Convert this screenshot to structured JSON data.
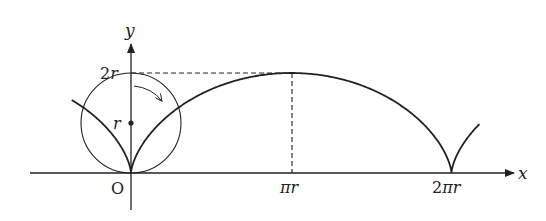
{
  "diagram": {
    "axes": {
      "x_label": "x",
      "y_label": "y",
      "origin_label": "O"
    },
    "y_ticks": [
      {
        "label": "2r",
        "value": "2r"
      },
      {
        "label": "r",
        "value": "r"
      }
    ],
    "x_ticks": [
      {
        "label": "πr",
        "value": "πr"
      },
      {
        "label": "2πr",
        "value": "2πr"
      }
    ],
    "elements": [
      "cycloid curve with cusps at x=0 and x=2πr",
      "rolling circle of radius r centered at (0, r)",
      "center point marked at (0, r)",
      "curved arrow showing clockwise rotation",
      "dashed line from (0,2r) to (πr,2r)",
      "dashed vertical line from (πr,0) to (πr,2r)"
    ],
    "colors": {
      "stroke": "#222222",
      "background": "#ffffff"
    }
  }
}
